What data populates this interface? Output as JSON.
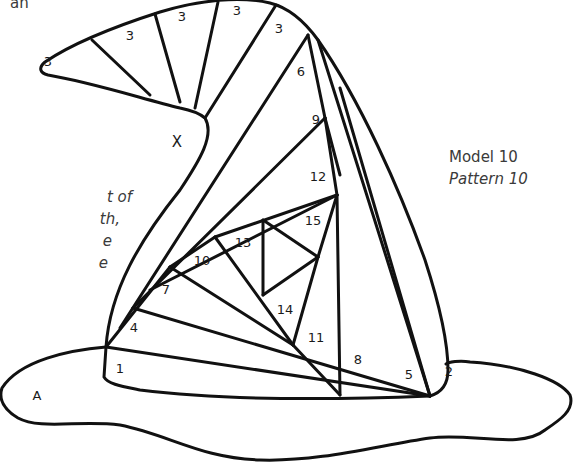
{
  "caption": {
    "model": "Model 10",
    "pattern": "Pattern 10"
  },
  "text_fragments": {
    "top_left": "an",
    "left_lines": [
      "t of",
      "th,",
      "e",
      "e"
    ]
  },
  "diagram": {
    "type": "iris-folding hat pattern",
    "labels": {
      "brim": "A",
      "curl_gap": "X",
      "strip_1": "1",
      "strip_2": "2",
      "strip_3a": "3",
      "strip_3b": "3",
      "strip_3c": "3",
      "strip_3d": "3",
      "strip_3e": "3",
      "strip_4": "4",
      "strip_5": "5",
      "strip_6": "6",
      "strip_7": "7",
      "strip_8": "8",
      "strip_9": "9",
      "strip_10": "10",
      "strip_11": "11",
      "strip_12": "12",
      "strip_13": "13",
      "strip_14": "14",
      "strip_15": "15"
    },
    "line_color": "#111111",
    "text_color": "#1a1a1a"
  }
}
